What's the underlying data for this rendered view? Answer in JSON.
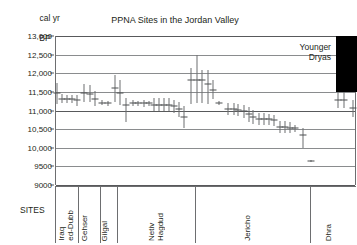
{
  "chart_data": {
    "type": "scatter",
    "title": "PPNA Sites in the Jordan Valley",
    "ylabel_line1": "cal yr",
    "ylabel_line2": "BP",
    "xlabel": "SITES",
    "ylim": [
      9000,
      13000
    ],
    "ytick_values": [
      13000,
      12500,
      12000,
      11500,
      11000,
      10500,
      10000,
      9500,
      9000
    ],
    "ytick_labels": [
      "13,000",
      "12,500",
      "12,000",
      "11,500",
      "11,000",
      "10,500",
      "10,000",
      "9500",
      "9000"
    ],
    "grid": true,
    "legend": "none",
    "annotations": [
      {
        "name": "younger-dryas",
        "text_line1": "Younger",
        "text_line2": "Dryas",
        "color": "#000000",
        "y_top": 13000,
        "y_bottom": 11500,
        "x_start_pct": 93.0,
        "x_end_pct": 100.0
      }
    ],
    "sites": [
      {
        "name": "Iraq\ned-Dubb",
        "x_start_pct": 0.0,
        "x_end_pct": 7.6
      },
      {
        "name": "Gehser",
        "x_start_pct": 7.6,
        "x_end_pct": 15.0
      },
      {
        "name": "Gilgal",
        "x_start_pct": 15.0,
        "x_end_pct": 20.6
      },
      {
        "name": "Netiv\nHagdud",
        "x_start_pct": 20.6,
        "x_end_pct": 46.5
      },
      {
        "name": "Jericho",
        "x_start_pct": 46.5,
        "x_end_pct": 84.7
      },
      {
        "name": "Dhra",
        "x_start_pct": 84.7,
        "x_end_pct": 100.0
      }
    ],
    "series": [
      {
        "name": "radiocarbon determinations",
        "marker": "error-bar",
        "color": "#6d6e70",
        "points": [
          {
            "x_pct": 0.3,
            "y": 11480,
            "lo": 11180,
            "hi": 11730
          },
          {
            "x_pct": 2.0,
            "y": 11320,
            "lo": 11210,
            "hi": 11430
          },
          {
            "x_pct": 3.6,
            "y": 11310,
            "lo": 11210,
            "hi": 11410
          },
          {
            "x_pct": 5.3,
            "y": 11300,
            "lo": 11190,
            "hi": 11410
          },
          {
            "x_pct": 7.0,
            "y": 11270,
            "lo": 11120,
            "hi": 11420
          },
          {
            "x_pct": 9.3,
            "y": 11480,
            "lo": 11240,
            "hi": 11720
          },
          {
            "x_pct": 11.3,
            "y": 11450,
            "lo": 11220,
            "hi": 11680
          },
          {
            "x_pct": 13.0,
            "y": 11320,
            "lo": 11120,
            "hi": 11520
          },
          {
            "x_pct": 15.3,
            "y": 11210,
            "lo": 11150,
            "hi": 11280
          },
          {
            "x_pct": 17.3,
            "y": 11190,
            "lo": 11130,
            "hi": 11250
          },
          {
            "x_pct": 19.6,
            "y": 11600,
            "lo": 11240,
            "hi": 11960
          },
          {
            "x_pct": 21.3,
            "y": 11480,
            "lo": 11140,
            "hi": 11830
          },
          {
            "x_pct": 23.3,
            "y": 11150,
            "lo": 10680,
            "hi": 11330
          },
          {
            "x_pct": 25.6,
            "y": 11200,
            "lo": 11130,
            "hi": 11270
          },
          {
            "x_pct": 27.3,
            "y": 11190,
            "lo": 11120,
            "hi": 11260
          },
          {
            "x_pct": 29.3,
            "y": 11190,
            "lo": 11100,
            "hi": 11280
          },
          {
            "x_pct": 31.0,
            "y": 11190,
            "lo": 11120,
            "hi": 11260
          },
          {
            "x_pct": 32.6,
            "y": 11160,
            "lo": 10980,
            "hi": 11330
          },
          {
            "x_pct": 34.3,
            "y": 11160,
            "lo": 10980,
            "hi": 11330
          },
          {
            "x_pct": 36.0,
            "y": 11160,
            "lo": 10980,
            "hi": 11330
          },
          {
            "x_pct": 37.6,
            "y": 11160,
            "lo": 10980,
            "hi": 11330
          },
          {
            "x_pct": 39.3,
            "y": 11110,
            "lo": 10930,
            "hi": 11290
          },
          {
            "x_pct": 41.0,
            "y": 11030,
            "lo": 10830,
            "hi": 11230
          },
          {
            "x_pct": 42.6,
            "y": 10820,
            "lo": 10520,
            "hi": 11120
          },
          {
            "x_pct": 45.0,
            "y": 11830,
            "lo": 11170,
            "hi": 12140
          },
          {
            "x_pct": 47.0,
            "y": 11830,
            "lo": 11190,
            "hi": 12480
          },
          {
            "x_pct": 48.6,
            "y": 11820,
            "lo": 11200,
            "hi": 12100
          },
          {
            "x_pct": 50.6,
            "y": 11700,
            "lo": 11180,
            "hi": 12090
          },
          {
            "x_pct": 52.3,
            "y": 11560,
            "lo": 11320,
            "hi": 11810
          },
          {
            "x_pct": 54.3,
            "y": 11190,
            "lo": 11140,
            "hi": 11250
          },
          {
            "x_pct": 57.3,
            "y": 11030,
            "lo": 10870,
            "hi": 11190
          },
          {
            "x_pct": 59.0,
            "y": 11040,
            "lo": 10880,
            "hi": 11200
          },
          {
            "x_pct": 60.6,
            "y": 11010,
            "lo": 10860,
            "hi": 11170
          },
          {
            "x_pct": 62.3,
            "y": 10980,
            "lo": 10800,
            "hi": 11160
          },
          {
            "x_pct": 64.0,
            "y": 10900,
            "lo": 10700,
            "hi": 11100
          },
          {
            "x_pct": 65.6,
            "y": 10830,
            "lo": 10650,
            "hi": 11010
          },
          {
            "x_pct": 67.3,
            "y": 10780,
            "lo": 10620,
            "hi": 10940
          },
          {
            "x_pct": 69.0,
            "y": 10770,
            "lo": 10620,
            "hi": 10920
          },
          {
            "x_pct": 70.6,
            "y": 10760,
            "lo": 10610,
            "hi": 10910
          },
          {
            "x_pct": 72.3,
            "y": 10740,
            "lo": 10590,
            "hi": 10890
          },
          {
            "x_pct": 74.3,
            "y": 10560,
            "lo": 10400,
            "hi": 10720
          },
          {
            "x_pct": 76.0,
            "y": 10550,
            "lo": 10390,
            "hi": 10710
          },
          {
            "x_pct": 77.6,
            "y": 10540,
            "lo": 10400,
            "hi": 10680
          },
          {
            "x_pct": 79.3,
            "y": 10520,
            "lo": 10420,
            "hi": 10620
          },
          {
            "x_pct": 82.0,
            "y": 10340,
            "lo": 10000,
            "hi": 10540
          },
          {
            "x_pct": 84.6,
            "y": 9640,
            "lo": 9620,
            "hi": 9660
          },
          {
            "x_pct": 93.6,
            "y": 11290,
            "lo": 11070,
            "hi": 11510
          },
          {
            "x_pct": 95.6,
            "y": 11280,
            "lo": 11060,
            "hi": 11500
          },
          {
            "x_pct": 98.6,
            "y": 11060,
            "lo": 10830,
            "hi": 11290
          }
        ]
      }
    ]
  }
}
